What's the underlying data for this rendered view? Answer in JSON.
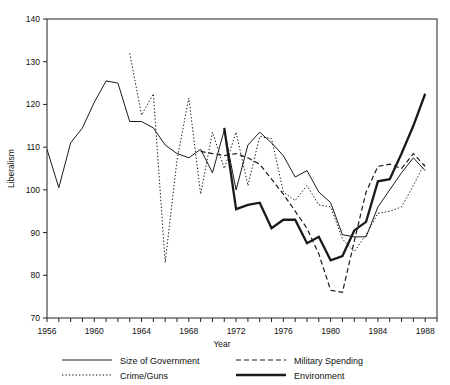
{
  "chart_data": {
    "type": "line",
    "title": "",
    "xlabel": "Year",
    "ylabel": "Liberalism",
    "xlim": [
      1956,
      1989
    ],
    "ylim": [
      70,
      140
    ],
    "xticks": [
      1956,
      1957,
      1958,
      1959,
      1960,
      1961,
      1962,
      1963,
      1964,
      1965,
      1966,
      1967,
      1968,
      1969,
      1970,
      1971,
      1972,
      1973,
      1974,
      1975,
      1976,
      1977,
      1978,
      1979,
      1980,
      1981,
      1982,
      1983,
      1984,
      1985,
      1986,
      1987,
      1988,
      1989
    ],
    "xtick_labels": [
      "1956",
      "1960",
      "1964",
      "1968",
      "1972",
      "1976",
      "1980",
      "1984",
      "1988"
    ],
    "xtick_label_values": [
      1956,
      1960,
      1964,
      1968,
      1972,
      1976,
      1980,
      1984,
      1988
    ],
    "yticks": [
      70,
      80,
      90,
      100,
      110,
      120,
      130,
      140
    ],
    "ytick_labels": [
      "70",
      "80",
      "90",
      "100",
      "110",
      "120",
      "130",
      "140"
    ],
    "grid": false,
    "legend_position": "below",
    "series": [
      {
        "name": "Size of Government",
        "style": "solid-thin",
        "stroke_width": 1.0,
        "dash": "none",
        "color": "#1a1a1a",
        "x": [
          1956,
          1957,
          1958,
          1959,
          1960,
          1961,
          1962,
          1963,
          1964,
          1965,
          1966,
          1967,
          1968,
          1969,
          1970,
          1971,
          1972,
          1973,
          1974,
          1975,
          1976,
          1977,
          1978,
          1979,
          1980,
          1981,
          1982,
          1983,
          1984,
          1985,
          1986,
          1987,
          1988
        ],
        "y": [
          109.5,
          100.5,
          111.0,
          114.5,
          120.5,
          125.5,
          125.0,
          116.0,
          116.0,
          114.5,
          110.5,
          108.5,
          107.5,
          109.5,
          104.0,
          114.0,
          100.0,
          110.5,
          113.5,
          111.0,
          108.0,
          103.0,
          104.5,
          99.5,
          97.0,
          89.5,
          89.0,
          89.0,
          96.0,
          100.0,
          104.0,
          107.5,
          104.5
        ]
      },
      {
        "name": "Military Spending",
        "style": "dashed",
        "stroke_width": 1.2,
        "dash": "5,3",
        "color": "#1a1a1a",
        "x": [
          1969,
          1970,
          1971,
          1972,
          1973,
          1974,
          1975,
          1976,
          1977,
          1978,
          1979,
          1980,
          1981,
          1982,
          1983,
          1984,
          1985,
          1986,
          1987,
          1988
        ],
        "y": [
          109.0,
          108.5,
          108.0,
          108.5,
          107.5,
          106.0,
          102.5,
          99.0,
          95.0,
          91.0,
          85.0,
          76.5,
          76.0,
          88.0,
          99.5,
          105.5,
          106.0,
          105.0,
          108.5,
          105.5
        ]
      },
      {
        "name": "Crime/Guns",
        "style": "dotted",
        "stroke_width": 1.0,
        "dash": "1.4,2",
        "color": "#1a1a1a",
        "x": [
          1963,
          1964,
          1965,
          1966,
          1967,
          1968,
          1969,
          1970,
          1971,
          1972,
          1973,
          1974,
          1975,
          1976,
          1977,
          1978,
          1979,
          1980,
          1981,
          1982,
          1983,
          1984,
          1985,
          1986,
          1987,
          1988
        ],
        "y": [
          132.0,
          117.5,
          122.5,
          83.0,
          107.0,
          121.5,
          99.0,
          113.5,
          105.0,
          113.5,
          101.0,
          112.5,
          112.0,
          99.5,
          97.5,
          101.0,
          96.5,
          96.0,
          88.5,
          85.5,
          89.5,
          94.5,
          95.0,
          96.0,
          101.0,
          106.5
        ]
      },
      {
        "name": "Environment",
        "style": "solid-thick",
        "stroke_width": 2.3,
        "dash": "none",
        "color": "#1a1a1a",
        "x": [
          1971,
          1972,
          1973,
          1974,
          1975,
          1976,
          1977,
          1978,
          1979,
          1980,
          1981,
          1982,
          1983,
          1984,
          1985,
          1986,
          1987,
          1988
        ],
        "y": [
          114.5,
          95.5,
          96.5,
          97.0,
          91.0,
          93.0,
          93.0,
          87.5,
          89.0,
          83.5,
          84.5,
          90.5,
          92.5,
          102.0,
          102.5,
          108.5,
          115.0,
          122.5
        ]
      }
    ],
    "legend_entries": [
      {
        "label": "Size of Government",
        "style": "solid-thin"
      },
      {
        "label": "Military Spending",
        "style": "dashed"
      },
      {
        "label": "Crime/Guns",
        "style": "dotted"
      },
      {
        "label": "Environment",
        "style": "solid-thick"
      }
    ]
  }
}
